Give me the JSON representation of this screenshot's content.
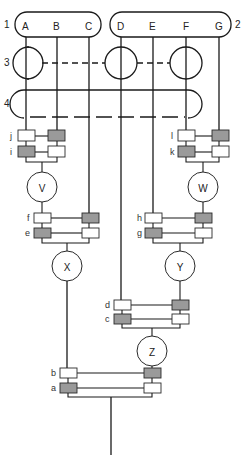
{
  "diagram": {
    "type": "merge-tree",
    "inputs": {
      "group1": {
        "label": "1",
        "items": [
          "A",
          "B",
          "C"
        ]
      },
      "group2": {
        "label": "2",
        "items": [
          "D",
          "E",
          "F",
          "G"
        ]
      }
    },
    "rows": {
      "row3": {
        "label": "3"
      },
      "row4": {
        "label": "4"
      }
    },
    "nodes": {
      "V": "V",
      "W": "W",
      "X": "X",
      "Y": "Y",
      "Z": "Z"
    },
    "switches": {
      "j": "j",
      "i": "i",
      "l": "l",
      "k": "k",
      "f": "f",
      "e": "e",
      "h": "h",
      "g": "g",
      "d": "d",
      "c": "c",
      "b": "b",
      "a": "a"
    },
    "colors": {
      "line": "#1a1a1a",
      "shaded_box": "#9a9a9a",
      "open_box": "#ffffff"
    }
  }
}
